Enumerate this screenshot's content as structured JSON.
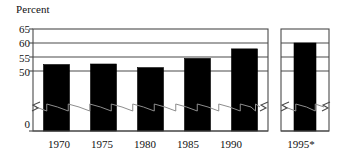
{
  "chart_data": {
    "type": "bar",
    "title": "",
    "ylabel": "Percent",
    "xlabel": "",
    "categories": [
      "1970",
      "1975",
      "1980",
      "1985",
      "1990",
      "1995*"
    ],
    "values": [
      52.3,
      52.5,
      51.2,
      54.5,
      57.9,
      60.0
    ],
    "series": [
      {
        "name": "Percent",
        "values": [
          52.3,
          52.5,
          51.2,
          54.5,
          57.9,
          60.0
        ]
      }
    ],
    "ylim": [
      0,
      65
    ],
    "y_ticks": [
      "0",
      "50",
      "55",
      "60",
      "65"
    ],
    "y_tick_values": [
      0,
      50,
      55,
      60,
      65
    ],
    "axis_break": true,
    "axis_break_between": [
      0,
      50
    ],
    "grid": true,
    "gridlines_at": [
      50,
      55,
      60
    ],
    "legend": "none",
    "panels": [
      {
        "name": "main-panel",
        "categories": [
          "1970",
          "1975",
          "1980",
          "1985",
          "1990"
        ],
        "values": [
          52.3,
          52.5,
          51.2,
          54.5,
          57.9
        ]
      },
      {
        "name": "projection-panel",
        "categories": [
          "1995*"
        ],
        "values": [
          60.0
        ]
      }
    ],
    "bar_color": "#000000",
    "axis_color": "#4a4a4a",
    "plot_background": "#ffffff",
    "footnote_marker": "*"
  },
  "axis": {
    "ylabel": "Percent",
    "ticks": [
      {
        "label": "65"
      },
      {
        "label": "60"
      },
      {
        "label": "55"
      },
      {
        "label": "50"
      },
      {
        "label": "0"
      }
    ]
  },
  "xaxis": {
    "labels": [
      {
        "label": "1970"
      },
      {
        "label": "1975"
      },
      {
        "label": "1980"
      },
      {
        "label": "1985"
      },
      {
        "label": "1990"
      },
      {
        "label": "1995*"
      }
    ]
  }
}
